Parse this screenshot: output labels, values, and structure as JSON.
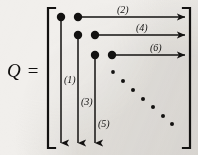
{
  "figure": {
    "name": "matrix-householder-zeroing-diagram",
    "matrix_label": "Q =",
    "background_color": "#f1efec",
    "ink_color": "#131211",
    "bracket": {
      "left_x": 48,
      "right_x": 190,
      "top_y": 8,
      "bottom_y": 148,
      "serif_len": 7,
      "stroke": 2.2
    },
    "big_dots": [
      {
        "id": "d11",
        "cx": 61,
        "cy": 17,
        "r": 4.2
      },
      {
        "id": "d12",
        "cx": 78,
        "cy": 17,
        "r": 4.2
      },
      {
        "id": "d22",
        "cx": 78,
        "cy": 35,
        "r": 4.2
      },
      {
        "id": "d23",
        "cx": 95,
        "cy": 35,
        "r": 4.2
      },
      {
        "id": "d33",
        "cx": 95,
        "cy": 55,
        "r": 4.2
      },
      {
        "id": "d34",
        "cx": 112,
        "cy": 55,
        "r": 4.2
      }
    ],
    "ellipsis_dots": [
      {
        "cx": 113,
        "cy": 72,
        "r": 1.9
      },
      {
        "cx": 123,
        "cy": 81,
        "r": 2.0
      },
      {
        "cx": 133,
        "cy": 90,
        "r": 2.0
      },
      {
        "cx": 143,
        "cy": 99,
        "r": 2.0
      },
      {
        "cx": 153,
        "cy": 107,
        "r": 2.0
      },
      {
        "cx": 163,
        "cy": 116,
        "r": 2.0
      },
      {
        "cx": 172,
        "cy": 124,
        "r": 2.0
      }
    ],
    "horizontal_arrows": [
      {
        "label": "(2)",
        "x1": 78,
        "x2": 185,
        "y": 17,
        "label_x": 117,
        "label_y": 5
      },
      {
        "label": "(4)",
        "x1": 95,
        "x2": 185,
        "y": 35,
        "label_x": 136,
        "label_y": 23
      },
      {
        "label": "(6)",
        "x1": 112,
        "x2": 185,
        "y": 55,
        "label_x": 150,
        "label_y": 43
      }
    ],
    "vertical_arrows": [
      {
        "label": "(1)",
        "x": 61,
        "y1": 17,
        "y2": 143,
        "label_x": 64,
        "label_y": 75
      },
      {
        "label": "(3)",
        "x": 78,
        "y1": 35,
        "y2": 143,
        "label_x": 81,
        "label_y": 97
      },
      {
        "label": "(5)",
        "x": 95,
        "y1": 55,
        "y2": 143,
        "label_x": 98,
        "label_y": 119
      }
    ]
  }
}
